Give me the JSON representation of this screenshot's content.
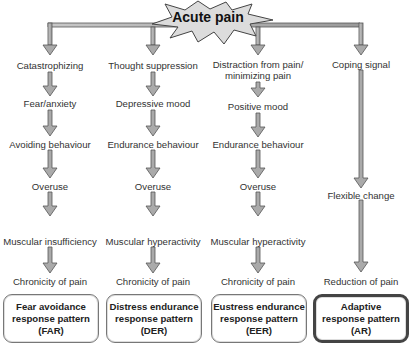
{
  "root": {
    "label": "Acute pain"
  },
  "columns": [
    {
      "steps": [
        "Catastrophizing",
        "Fear/anxiety",
        "Avoiding behaviour",
        "Overuse",
        "Muscular insufficiency",
        "Chronicity of pain"
      ],
      "pattern": {
        "line1": "Fear avoidance",
        "line2": "response pattern",
        "line3": "(FAR)"
      }
    },
    {
      "steps": [
        "Thought suppression",
        "Depressive mood",
        "Endurance behaviour",
        "Overuse",
        "Muscular hyperactivity",
        "Chronicity of pain"
      ],
      "pattern": {
        "line1": "Distress endurance",
        "line2": "response pattern",
        "line3": "(DER)"
      }
    },
    {
      "steps": [
        "Distraction from pain/",
        "minimizing pain",
        "Positive mood",
        "Endurance behaviour",
        "Overuse",
        "Muscular hyperactivity",
        "Chronicity of pain"
      ],
      "pattern": {
        "line1": "Eustress endurance",
        "line2": "response pattern",
        "line3": "(EER)"
      }
    },
    {
      "steps": [
        "Coping signal",
        "Flexible change",
        "Reduction of pain"
      ],
      "pattern": {
        "line1": "Adaptive",
        "line2": "response pattern",
        "line3": "(AR)"
      }
    }
  ],
  "colors": {
    "arrow_fill": "#aaaaaa",
    "arrow_stroke": "#555555",
    "burst_fill": "#dddddd"
  }
}
